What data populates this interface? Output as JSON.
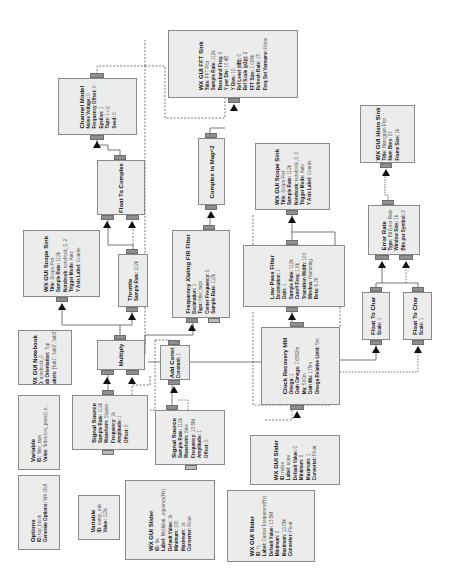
{
  "diagram": {
    "rotation_deg": -90,
    "colors": {
      "block_fill": "#ececec",
      "block_border": "#8a8a8a",
      "port": "#8e8e8e",
      "wire": "#555555",
      "arrow": "#111111"
    },
    "blocks": {
      "fft_sink": {
        "title": "WX GUI FFT Sink",
        "params": [
          {
            "k": "Title:",
            "v": "FFT Plot"
          },
          {
            "k": "Sample Rate:",
            "v": "112k"
          },
          {
            "k": "Baseband Freq:",
            "v": "0"
          },
          {
            "k": "Y per Div:",
            "v": "10 dB"
          },
          {
            "k": "Y Divs:",
            "v": "10"
          },
          {
            "k": "Ref Level (dB):",
            "v": "0"
          },
          {
            "k": "Ref Scale (p2p):",
            "v": "2"
          },
          {
            "k": "FFT Size:",
            "v": "1.024k"
          },
          {
            "k": "Refresh Rate:",
            "v": "15"
          },
          {
            "k": "Freq Set Varname:",
            "v": "None"
          }
        ]
      },
      "channel_model": {
        "title": "Channel Model",
        "params": [
          {
            "k": "Noise Voltage:",
            "v": "0"
          },
          {
            "k": "Frequency Offset:",
            "v": "0"
          },
          {
            "k": "Epsilon:",
            "v": "1"
          },
          {
            "k": "Taps:",
            "v": "1+1j"
          },
          {
            "k": "Seed:",
            "v": "0"
          }
        ]
      },
      "float_to_complex": {
        "title": "Float To Complex",
        "params": []
      },
      "complex_to_mag2": {
        "title": "Complex to Mag^2",
        "params": []
      },
      "scope_sink_right": {
        "title": "WX GUI Scope Sink",
        "params": [
          {
            "k": "Title:",
            "v": "Scope Plot"
          },
          {
            "k": "Sample Rate:",
            "v": "112k"
          },
          {
            "k": "Notebook:",
            "v": "notebook_0, 0"
          },
          {
            "k": "Trigger Mode:",
            "v": "Auto"
          },
          {
            "k": "Y Axis Label:",
            "v": "Counts"
          }
        ]
      },
      "histo_sink": {
        "title": "WX GUI Histo Sink",
        "params": [
          {
            "k": "Title:",
            "v": "Histogram Plot"
          },
          {
            "k": "Num Bins:",
            "v": "27"
          },
          {
            "k": "Frame Size:",
            "v": "1k"
          }
        ]
      },
      "scope_sink_left": {
        "title": "WX GUI Scope Sink",
        "params": [
          {
            "k": "Title:",
            "v": "Scope Plot"
          },
          {
            "k": "Sample Rate:",
            "v": "112k"
          },
          {
            "k": "Notebook:",
            "v": "notebook_0, 2"
          },
          {
            "k": "Trigger Mode:",
            "v": "Auto"
          },
          {
            "k": "Y Axis Label:",
            "v": "Counts"
          }
        ]
      },
      "throttle": {
        "title": "Throttle",
        "params": [
          {
            "k": "Sample Rate:",
            "v": "112k"
          }
        ]
      },
      "freq_xlating": {
        "title": "Frequency Xlating FIR Filter",
        "params": [
          {
            "k": "Decimation:",
            "v": "1"
          },
          {
            "k": "Taps:",
            "v": "filter_taps"
          },
          {
            "k": "Center Frequency:",
            "v": "0"
          },
          {
            "k": "Sample Rate:",
            "v": "112k"
          }
        ]
      },
      "low_pass": {
        "title": "Low Pass Filter",
        "params": [
          {
            "k": "Decimation:",
            "v": "1"
          },
          {
            "k": "Gain:",
            "v": "1"
          },
          {
            "k": "Sample Rate:",
            "v": "112k"
          },
          {
            "k": "Cutoff Freq:",
            "v": "1.6k"
          },
          {
            "k": "Transition Width:",
            "v": "100"
          },
          {
            "k": "Window:",
            "v": "Hamming"
          },
          {
            "k": "Beta:",
            "v": "6.76"
          }
        ]
      },
      "error_rate": {
        "title": "Error Rate",
        "params": [
          {
            "k": "Type:",
            "v": "Bit Error Rate"
          },
          {
            "k": "Window Size:",
            "v": "1k"
          },
          {
            "k": "Bits per Symbol:",
            "v": "2"
          }
        ]
      },
      "float_to_char_1": {
        "title": "Float To Char",
        "params": [
          {
            "k": "Scale:",
            "v": "1"
          }
        ]
      },
      "float_to_char_2": {
        "title": "Float To Char",
        "params": [
          {
            "k": "Scale:",
            "v": "1"
          }
        ]
      },
      "notebook": {
        "title": "WX GUI Notebook",
        "params": [
          {
            "k": "ID:",
            "v": "notebook_0"
          },
          {
            "k": "Tab Orientation:",
            "v": "Top"
          },
          {
            "k": "Labels:",
            "v": "['tab1', 'tab2', 'tab3']"
          }
        ]
      },
      "multiply": {
        "title": "Multiply",
        "params": []
      },
      "add_const": {
        "title": "Add Const",
        "params": [
          {
            "k": "Constant:",
            "v": "1"
          }
        ]
      },
      "clock_recovery": {
        "title": "Clock Recovery MM",
        "params": [
          {
            "k": "Omega:",
            "v": "1"
          },
          {
            "k": "Gain Omega:",
            "v": "7.6562m"
          },
          {
            "k": "Mu:",
            "v": "500m"
          },
          {
            "k": "Gain Mu:",
            "v": "175m"
          },
          {
            "k": "Omega Relative Limit:",
            "v": "5m"
          }
        ]
      },
      "variable_freq": {
        "title": "Variable",
        "params": [
          {
            "k": "ID:",
            "v": "filter_taps"
          },
          {
            "k": "Value:",
            "v": "firdes.low_pass(1,s..."
          }
        ]
      },
      "signal_source_1": {
        "title": "Signal Source",
        "params": [
          {
            "k": "Sample Rate:",
            "v": "112k"
          },
          {
            "k": "Waveform:",
            "v": "Square"
          },
          {
            "k": "Frequency:",
            "v": "1k"
          },
          {
            "k": "Amplitude:",
            "v": "1"
          },
          {
            "k": "Offset:",
            "v": "0"
          }
        ]
      },
      "signal_source_2": {
        "title": "Signal Source",
        "params": [
          {
            "k": "Sample Rate:",
            "v": "112k"
          },
          {
            "k": "Waveform:",
            "v": "Sine"
          },
          {
            "k": "Frequency:",
            "v": "13.5M"
          },
          {
            "k": "Amplitude:",
            "v": "1"
          },
          {
            "k": "Offset:",
            "v": "0"
          }
        ]
      },
      "options": {
        "title": "Options",
        "params": [
          {
            "k": "ID:",
            "v": "top_block"
          },
          {
            "k": "Generate Options:",
            "v": "WX GUI"
          }
        ]
      },
      "variable_samp_rate": {
        "title": "Variable",
        "params": [
          {
            "k": "ID:",
            "v": "samp_rate"
          },
          {
            "k": "Value:",
            "v": "112k"
          }
        ]
      },
      "slider_freq": {
        "title": "WX GUI Slider",
        "params": [
          {
            "k": "ID:",
            "v": "fm"
          },
          {
            "k": "Label:",
            "v": "Modulati...equency(Hz)"
          },
          {
            "k": "Default Value:",
            "v": "1k"
          },
          {
            "k": "Minimum:",
            "v": "100"
          },
          {
            "k": "Maximum:",
            "v": "1k"
          },
          {
            "k": "Converter:",
            "v": "Float"
          }
        ]
      },
      "slider_noise": {
        "title": "WX GUI Slider",
        "params": [
          {
            "k": "ID:",
            "v": "noise"
          },
          {
            "k": "Label:",
            "v": "noise"
          },
          {
            "k": "Default Value:",
            "v": "0"
          },
          {
            "k": "Minimum:",
            "v": "0"
          },
          {
            "k": "Maximum:",
            "v": "1"
          },
          {
            "k": "Converter:",
            "v": "Float"
          }
        ]
      },
      "slider_fc": {
        "title": "WX GUI Slider",
        "params": [
          {
            "k": "ID:",
            "v": "fc"
          },
          {
            "k": "Label:",
            "v": "Carrier Frequency(Hz)"
          },
          {
            "k": "Default Value:",
            "v": "13.5M"
          },
          {
            "k": "Minimum:",
            "v": "0"
          },
          {
            "k": "Maximum:",
            "v": "13.5M"
          },
          {
            "k": "Converter:",
            "v": "Float"
          }
        ]
      }
    }
  }
}
